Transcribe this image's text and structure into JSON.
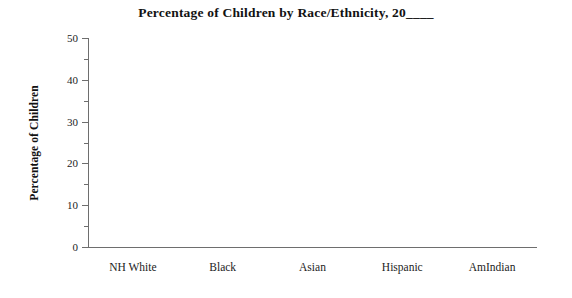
{
  "chart_data": {
    "type": "bar",
    "title": "Percentage of Children by Race/Ethnicity, 20____",
    "xlabel": "",
    "ylabel": "Percentage of Children",
    "categories": [
      "NH White",
      "Black",
      "Asian",
      "Hispanic",
      "AmIndian"
    ],
    "values": [
      null,
      null,
      null,
      null,
      null
    ],
    "series": [
      {
        "name": "Percentage of Children",
        "values": [
          null,
          null,
          null,
          null,
          null
        ]
      }
    ],
    "ylim": [
      0,
      50
    ],
    "ytick_labels": [
      "0",
      "10",
      "20",
      "30",
      "40",
      "50"
    ],
    "ytick_values": [
      0,
      10,
      20,
      30,
      40,
      50
    ],
    "yminor_values": [
      5,
      15,
      25,
      35,
      45
    ],
    "grid": false,
    "legend": false,
    "legend_position": "none",
    "annotations": [],
    "note": "Blank worksheet template: axes and labels drawn, no data plotted",
    "colors": {
      "axis": "#6e6e6e",
      "text": "#1c1c1c",
      "title": "#121212",
      "background": "#ffffff"
    }
  }
}
